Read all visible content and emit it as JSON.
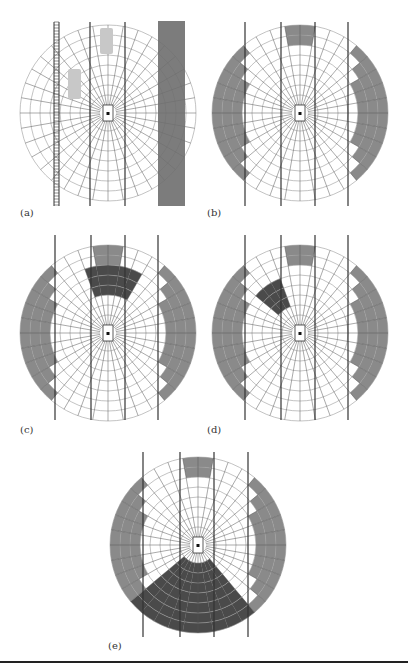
{
  "figure": {
    "panels": [
      {
        "id": "a",
        "label": "(a)",
        "description": "Polar occupancy grid around ego vehicle with guardrail (left), two other vehicles, and roadside vegetation (right)"
      },
      {
        "id": "b",
        "label": "(b)",
        "description": "Grid with static occluded/occupied regions shaded"
      },
      {
        "id": "c",
        "label": "(c)",
        "description": "Grid with occupied region ahead of ego vehicle in dark shade"
      },
      {
        "id": "d",
        "label": "(d)",
        "description": "Grid with occupied region front-left of ego vehicle in dark shade"
      },
      {
        "id": "e",
        "label": "(e)",
        "description": "Grid with occupied region behind ego vehicle in dark shade"
      }
    ],
    "colors": {
      "grid_line": "#9a9a9a",
      "lane_line": "#333333",
      "occupied_gray": "#8a8a8a",
      "occupied_dark": "#4a4a4a",
      "vegetation": "#6e6e6e",
      "vehicle": "#c8c8c8"
    }
  }
}
